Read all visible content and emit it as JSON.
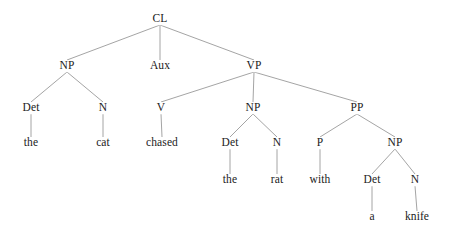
{
  "figure": {
    "kind": "syntax-tree-diagram",
    "sentence": "the cat chased the rat with a knife",
    "background_color": "#ffffff",
    "edge_color": "#9a9a9a",
    "text_color": "#1b1b1b",
    "width": 451,
    "height": 244
  },
  "nodes": [
    {
      "id": "cl",
      "label": "CL",
      "type": "category",
      "x": 160,
      "y": 19
    },
    {
      "id": "np1",
      "label": "NP",
      "type": "category",
      "x": 67,
      "y": 66
    },
    {
      "id": "aux",
      "label": "Aux",
      "type": "category",
      "x": 160,
      "y": 66
    },
    {
      "id": "vp",
      "label": "VP",
      "type": "category",
      "x": 254,
      "y": 66
    },
    {
      "id": "det1",
      "label": "Det",
      "type": "category",
      "x": 31,
      "y": 108
    },
    {
      "id": "n1",
      "label": "N",
      "type": "category",
      "x": 103,
      "y": 108
    },
    {
      "id": "v",
      "label": "V",
      "type": "category",
      "x": 161,
      "y": 108
    },
    {
      "id": "np2",
      "label": "NP",
      "type": "category",
      "x": 253,
      "y": 108
    },
    {
      "id": "pp",
      "label": "PP",
      "type": "category",
      "x": 357,
      "y": 108
    },
    {
      "id": "the1",
      "label": "the",
      "type": "terminal",
      "x": 31,
      "y": 143
    },
    {
      "id": "cat",
      "label": "cat",
      "type": "terminal",
      "x": 103,
      "y": 143
    },
    {
      "id": "chased",
      "label": "chased",
      "type": "terminal",
      "x": 162,
      "y": 143
    },
    {
      "id": "det2",
      "label": "Det",
      "type": "category",
      "x": 230,
      "y": 143
    },
    {
      "id": "n2",
      "label": "N",
      "type": "category",
      "x": 277,
      "y": 143
    },
    {
      "id": "p",
      "label": "P",
      "type": "category",
      "x": 320,
      "y": 143
    },
    {
      "id": "np3",
      "label": "NP",
      "type": "category",
      "x": 395,
      "y": 143
    },
    {
      "id": "the2",
      "label": "the",
      "type": "terminal",
      "x": 230,
      "y": 180
    },
    {
      "id": "rat",
      "label": "rat",
      "type": "terminal",
      "x": 277,
      "y": 180
    },
    {
      "id": "with",
      "label": "with",
      "type": "terminal",
      "x": 320,
      "y": 180
    },
    {
      "id": "det3",
      "label": "Det",
      "type": "category",
      "x": 372,
      "y": 180
    },
    {
      "id": "n3",
      "label": "N",
      "type": "category",
      "x": 415,
      "y": 180
    },
    {
      "id": "a",
      "label": "a",
      "type": "terminal",
      "x": 372,
      "y": 217
    },
    {
      "id": "knife",
      "label": "knife",
      "type": "terminal",
      "x": 417,
      "y": 217
    }
  ],
  "edges": [
    {
      "from": "cl",
      "to": "np1"
    },
    {
      "from": "cl",
      "to": "aux"
    },
    {
      "from": "cl",
      "to": "vp"
    },
    {
      "from": "np1",
      "to": "det1"
    },
    {
      "from": "np1",
      "to": "n1"
    },
    {
      "from": "aux",
      "to": null
    },
    {
      "from": "vp",
      "to": "v"
    },
    {
      "from": "vp",
      "to": "np2"
    },
    {
      "from": "vp",
      "to": "pp"
    },
    {
      "from": "det1",
      "to": "the1"
    },
    {
      "from": "n1",
      "to": "cat"
    },
    {
      "from": "v",
      "to": "chased"
    },
    {
      "from": "np2",
      "to": "det2"
    },
    {
      "from": "np2",
      "to": "n2"
    },
    {
      "from": "pp",
      "to": "p"
    },
    {
      "from": "pp",
      "to": "np3"
    },
    {
      "from": "det2",
      "to": "the2"
    },
    {
      "from": "n2",
      "to": "rat"
    },
    {
      "from": "p",
      "to": "with"
    },
    {
      "from": "np3",
      "to": "det3"
    },
    {
      "from": "np3",
      "to": "n3"
    },
    {
      "from": "det3",
      "to": "a"
    },
    {
      "from": "n3",
      "to": "knife"
    }
  ]
}
